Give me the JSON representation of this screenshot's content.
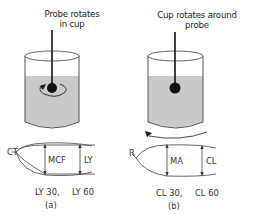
{
  "panels": [
    {
      "id": "a",
      "title": "Probe rotates in cup",
      "title_lines": [
        "Probe rotates",
        "in cup"
      ],
      "rotation": "probe",
      "trace_labels": {
        "start": "CT",
        "inner": "MCF",
        "outer": "LY"
      },
      "footer": {
        "left": "LY 30,",
        "right": "LY 60"
      },
      "caption": "(a)"
    },
    {
      "id": "b",
      "title": "Cup rotates around probe",
      "title_lines": [
        "Cup rotates around",
        "probe"
      ],
      "rotation": "cup",
      "trace_labels": {
        "start": "R",
        "inner": "MA",
        "outer": "CL"
      },
      "footer": {
        "left": "CL 30,",
        "right": "CL 60"
      },
      "caption": "(b)"
    }
  ],
  "colors": {
    "liquid": "#c9c9c9",
    "line": "#555555",
    "probe": "#111111",
    "text": "#333333"
  }
}
